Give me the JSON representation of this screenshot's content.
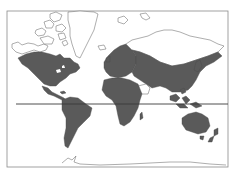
{
  "map": {
    "projection": "mercator",
    "theme": "world-population-distribution",
    "colors": {
      "background": "#ffffff",
      "inhabited_land": "#5a5a5a",
      "uninhabited_outline": "#6a6a6a",
      "equator": "#3a3a3a",
      "frame": "#8a8a8a"
    },
    "frame": {
      "x": 7,
      "y": 11,
      "width": 221,
      "height": 156
    },
    "equator": {
      "y": 104,
      "x_start": 16,
      "x_end": 228
    },
    "regions_filled": [
      "North America",
      "Central America",
      "South America",
      "Europe",
      "Africa",
      "Asia",
      "Southeast Asia",
      "Australia",
      "New Zealand"
    ],
    "regions_outline_only": [
      "Greenland",
      "Arctic Canada",
      "Northern Siberia",
      "Svalbard",
      "Antarctica",
      "Arabian interior",
      "Sahara interior"
    ]
  }
}
